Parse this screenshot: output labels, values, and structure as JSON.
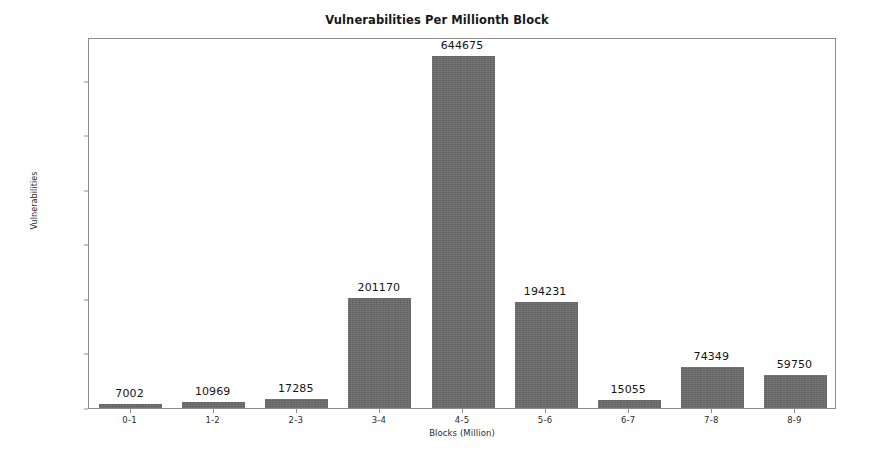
{
  "chart_data": {
    "type": "bar",
    "title": "Vulnerabilities Per Millionth Block",
    "xlabel": "Blocks (Million)",
    "ylabel": "Vulnerabilities",
    "categories": [
      "0-1",
      "1-2",
      "2-3",
      "3-4",
      "4-5",
      "5-6",
      "6-7",
      "7-8",
      "8-9"
    ],
    "values": [
      7002,
      10969,
      17285,
      201170,
      644675,
      194231,
      15055,
      74349,
      59750
    ],
    "value_labels": [
      "7002",
      "10969",
      "17285",
      "201170",
      "644675",
      "194231",
      "15055",
      "74349",
      "59750"
    ],
    "yticks": [
      0,
      100000,
      200000,
      300000,
      400000,
      500000,
      600000
    ],
    "ytick_labels": [
      "0",
      "100000",
      "200000",
      "300000",
      "400000",
      "500000",
      "600000"
    ],
    "ylim": [
      0,
      680000
    ],
    "grid": false,
    "legend": null,
    "bar_color": "#6c6c6c",
    "frame_color": "#8c8c8c",
    "background_color": "#ffffff"
  }
}
